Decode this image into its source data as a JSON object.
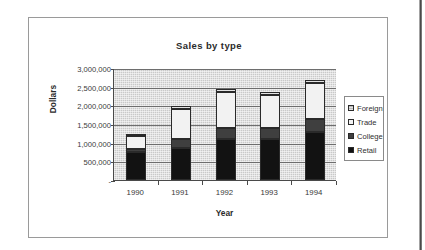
{
  "chart_data": {
    "type": "bar",
    "subtype": "stacked-column",
    "title": "Sales by type",
    "xlabel": "Year",
    "ylabel": "Dollars",
    "categories": [
      "1990",
      "1991",
      "1992",
      "1993",
      "1994"
    ],
    "ylim": [
      0,
      3000000
    ],
    "ytick_values": [
      0,
      500000,
      1000000,
      1500000,
      2000000,
      2500000,
      3000000
    ],
    "ytick_labels": [
      "-",
      "500,000",
      "1,000,000",
      "1,500,000",
      "2,000,000",
      "2,500,000",
      "3,000,000"
    ],
    "grid": true,
    "legend_position": "right",
    "stack_order_bottom_to_top": [
      "Retail",
      "College",
      "Trade",
      "Foreign"
    ],
    "series": [
      {
        "name": "Foreign",
        "color": "#b9b9b9",
        "values": [
          60000,
          70000,
          75000,
          70000,
          85000
        ]
      },
      {
        "name": "Trade",
        "color": "#f2f2f2",
        "values": [
          350000,
          800000,
          970000,
          900000,
          970000
        ]
      },
      {
        "name": "College",
        "color": "#3f3f3f",
        "values": [
          70000,
          240000,
          280000,
          290000,
          350000
        ]
      },
      {
        "name": "Retail",
        "color": "#121212",
        "values": [
          750000,
          860000,
          1100000,
          1100000,
          1280000
        ]
      }
    ],
    "totals": [
      1230000,
      1970000,
      2425000,
      2360000,
      2685000
    ]
  },
  "legend": {
    "items": [
      {
        "label": "Foreign",
        "swatch": "foreign"
      },
      {
        "label": "Trade",
        "swatch": "trade"
      },
      {
        "label": "College",
        "swatch": "college"
      },
      {
        "label": "Retail",
        "swatch": "retail"
      }
    ]
  }
}
